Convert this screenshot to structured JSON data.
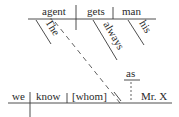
{
  "diagram": {
    "type": "sentence-diagram",
    "main_clause": {
      "subject": "agent",
      "verb": "gets",
      "object": "man",
      "modifiers": {
        "subject_article": "The",
        "verb_adverb": "always",
        "object_possessive": "his"
      }
    },
    "sub_clause": {
      "subject": "we",
      "verb": "know",
      "object": "[whom]",
      "complement_marker": "as",
      "complement": "Mr. X",
      "slash": "\\"
    }
  }
}
